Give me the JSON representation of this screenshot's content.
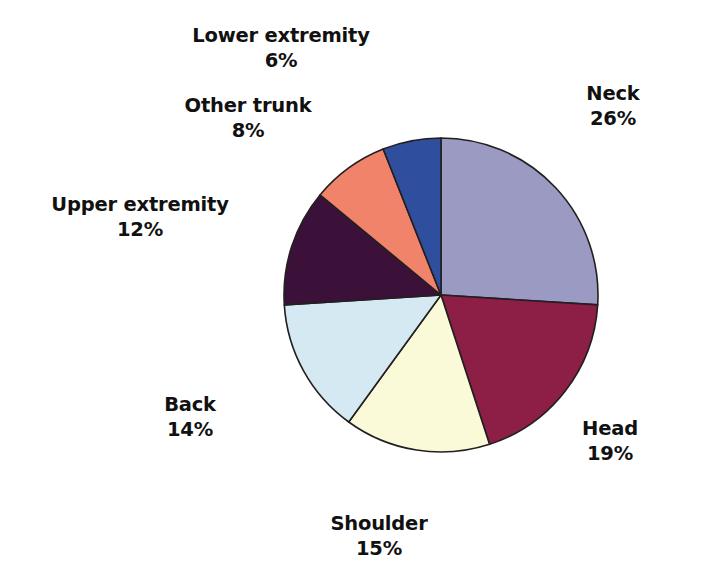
{
  "chart_data": {
    "type": "pie",
    "title": "",
    "subtitle": "",
    "xlabel": "",
    "ylabel": "",
    "legend_position": "none",
    "grid": false,
    "units": "percent",
    "start_angle_deg": 0,
    "direction": "clockwise",
    "total": 100,
    "categories": [
      "Neck",
      "Head",
      "Shoulder",
      "Back",
      "Upper extremity",
      "Other trunk",
      "Lower extremity"
    ],
    "values": [
      26,
      19,
      15,
      14,
      12,
      8,
      6
    ],
    "colors": [
      "#9a9ac2",
      "#8d1f47",
      "#fbfad8",
      "#d4e9f1",
      "#3b1139",
      "#f0836a",
      "#2f4f9e"
    ],
    "slices": [
      {
        "name": "Neck",
        "value": 26,
        "label": "Neck",
        "percent_label": "26%",
        "color": "#9a9ac2",
        "start_deg": 0,
        "end_deg": 93.6,
        "label_id": "label-neck"
      },
      {
        "name": "Head",
        "value": 19,
        "label": "Head",
        "percent_label": "19%",
        "color": "#8d1f47",
        "start_deg": 93.6,
        "end_deg": 162.0,
        "label_id": "label-head"
      },
      {
        "name": "Shoulder",
        "value": 15,
        "label": "Shoulder",
        "percent_label": "15%",
        "color": "#fbfad8",
        "start_deg": 162.0,
        "end_deg": 216.0,
        "label_id": "label-shoulder"
      },
      {
        "name": "Back",
        "value": 14,
        "label": "Back",
        "percent_label": "14%",
        "color": "#d4e9f1",
        "start_deg": 216.0,
        "end_deg": 266.4,
        "label_id": "label-back"
      },
      {
        "name": "Upper extremity",
        "value": 12,
        "label": "Upper extremity",
        "percent_label": "12%",
        "color": "#3b1139",
        "start_deg": 266.4,
        "end_deg": 309.6,
        "label_id": "label-upper-extremity"
      },
      {
        "name": "Other trunk",
        "value": 8,
        "label": "Other trunk",
        "percent_label": "8%",
        "color": "#f0836a",
        "start_deg": 309.6,
        "end_deg": 338.4,
        "label_id": "label-other-trunk"
      },
      {
        "name": "Lower extremity",
        "value": 6,
        "label": "Lower extremity",
        "percent_label": "6%",
        "color": "#2f4f9e",
        "start_deg": 338.4,
        "end_deg": 360.0,
        "label_id": "label-lower-extremity"
      }
    ],
    "geometry": {
      "center_x": 441,
      "center_y": 295,
      "radius": 157,
      "outline_color": "#231f20"
    }
  },
  "labels": {
    "neck": {
      "name": "Neck",
      "pct": "26%"
    },
    "head": {
      "name": "Head",
      "pct": "19%"
    },
    "shoulder": {
      "name": "Shoulder",
      "pct": "15%"
    },
    "back": {
      "name": "Back",
      "pct": "14%"
    },
    "upper_extremity": {
      "name": "Upper extremity",
      "pct": "12%"
    },
    "other_trunk": {
      "name": "Other trunk",
      "pct": "8%"
    },
    "lower_extremity": {
      "name": "Lower extremity",
      "pct": "6%"
    }
  }
}
